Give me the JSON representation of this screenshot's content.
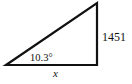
{
  "diagram": {
    "type": "right-triangle",
    "angle_label": "10.3°",
    "opposite_side_label": "1451",
    "adjacent_side_label": "x",
    "colors": {
      "stroke": "#111111",
      "background": "#ffffff"
    }
  }
}
